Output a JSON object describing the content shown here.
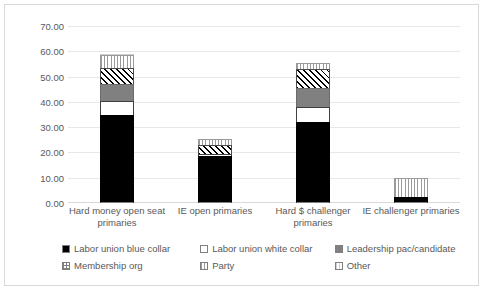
{
  "chart_data": {
    "type": "bar",
    "subtype": "stacked-bar",
    "title": "",
    "xlabel": "",
    "ylabel": "",
    "ylim": [
      0,
      70
    ],
    "ytick_labels": [
      "0.00",
      "10.00",
      "20.00",
      "30.00",
      "40.00",
      "50.00",
      "60.00",
      "70.00"
    ],
    "ytick_values": [
      0,
      10,
      20,
      30,
      40,
      50,
      60,
      70
    ],
    "grid": true,
    "legend_position": "bottom",
    "categories": [
      "Hard money open seat primaries",
      "IE open primaries",
      "Hard $ challenger primaries",
      "IE challenger primaries"
    ],
    "series": [
      {
        "name": "Labor union blue collar",
        "pattern": "solid-black",
        "values": [
          35.0,
          18.5,
          32.0,
          2.5
        ]
      },
      {
        "name": "Labor union white collar",
        "pattern": "white",
        "values": [
          5.5,
          1.0,
          6.0,
          0.0
        ]
      },
      {
        "name": "Leadership pac/candidate",
        "pattern": "gray",
        "values": [
          6.5,
          0.0,
          7.5,
          0.0
        ]
      },
      {
        "name": "Membership org",
        "pattern": "hatch",
        "values": [
          6.5,
          3.5,
          7.5,
          0.0
        ]
      },
      {
        "name": "Party",
        "pattern": "vstripe",
        "values": [
          5.0,
          2.5,
          2.5,
          7.5
        ]
      },
      {
        "name": "Other",
        "pattern": "vlight",
        "values": [
          0.5,
          0.0,
          0.0,
          0.0
        ]
      }
    ],
    "totals": [
      59.0,
      25.5,
      55.5,
      10.0
    ]
  },
  "legend": {
    "entries": [
      {
        "label": "Labor union blue collar",
        "swatch": "solid-black-swatch"
      },
      {
        "label": "Labor union white collar",
        "swatch": "white-swatch"
      },
      {
        "label": "Leadership pac/candidate",
        "swatch": "gray-swatch"
      },
      {
        "label": "Membership org",
        "swatch": "crosshatch-swatch"
      },
      {
        "label": "Party",
        "swatch": "vstripe-swatch"
      },
      {
        "label": "Other",
        "swatch": "vlight-swatch"
      }
    ]
  },
  "colors": {
    "black": "#000000",
    "gray": "#808080",
    "white": "#ffffff",
    "gridline": "#e8e8e8",
    "text": "#595959",
    "frame": "#d9d9d9"
  }
}
